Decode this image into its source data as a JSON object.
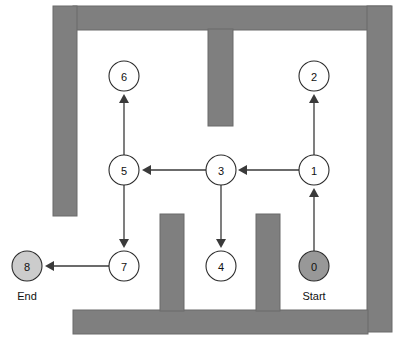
{
  "diagram": {
    "colors": {
      "wall_fill": "#7f7f7f",
      "wall_stroke": "#6b6b6b",
      "background": "#ffffff",
      "node_fill_default": "#ffffff",
      "node_fill_start": "#989898",
      "node_fill_end": "#cccccc",
      "node_stroke": "#2b2b2b",
      "edge_stroke": "#3a3a3a",
      "text": "#111111"
    },
    "nodes": [
      {
        "id": "node-0",
        "label": "0",
        "cx": 314,
        "cy": 266,
        "r": 15,
        "fill": "#989898",
        "caption": "Start",
        "caption_x": 314,
        "caption_y": 300
      },
      {
        "id": "node-1",
        "label": "1",
        "cx": 314,
        "cy": 170,
        "r": 15,
        "fill": "#ffffff",
        "caption": "",
        "caption_x": 0,
        "caption_y": 0
      },
      {
        "id": "node-2",
        "label": "2",
        "cx": 314,
        "cy": 76,
        "r": 15,
        "fill": "#ffffff",
        "caption": "",
        "caption_x": 0,
        "caption_y": 0
      },
      {
        "id": "node-3",
        "label": "3",
        "cx": 221,
        "cy": 170,
        "r": 15,
        "fill": "#ffffff",
        "caption": "",
        "caption_x": 0,
        "caption_y": 0
      },
      {
        "id": "node-4",
        "label": "4",
        "cx": 221,
        "cy": 266,
        "r": 15,
        "fill": "#ffffff",
        "caption": "",
        "caption_x": 0,
        "caption_y": 0
      },
      {
        "id": "node-5",
        "label": "5",
        "cx": 124,
        "cy": 170,
        "r": 15,
        "fill": "#ffffff",
        "caption": "",
        "caption_x": 0,
        "caption_y": 0
      },
      {
        "id": "node-6",
        "label": "6",
        "cx": 124,
        "cy": 76,
        "r": 15,
        "fill": "#ffffff",
        "caption": "",
        "caption_x": 0,
        "caption_y": 0
      },
      {
        "id": "node-7",
        "label": "7",
        "cx": 124,
        "cy": 266,
        "r": 15,
        "fill": "#ffffff",
        "caption": "",
        "caption_x": 0,
        "caption_y": 0
      },
      {
        "id": "node-8",
        "label": "8",
        "cx": 27,
        "cy": 266,
        "r": 15,
        "fill": "#cccccc",
        "caption": "End",
        "caption_x": 27,
        "caption_y": 300
      }
    ],
    "edges": [
      {
        "id": "edge-0-1",
        "from": "0",
        "to": "1",
        "x1": 314,
        "y1": 251,
        "x2": 314,
        "y2": 188,
        "dir": "up"
      },
      {
        "id": "edge-1-2",
        "from": "1",
        "to": "2",
        "x1": 314,
        "y1": 155,
        "x2": 314,
        "y2": 94,
        "dir": "up"
      },
      {
        "id": "edge-1-3",
        "from": "1",
        "to": "3",
        "x1": 299,
        "y1": 170,
        "x2": 238,
        "y2": 170,
        "dir": "left"
      },
      {
        "id": "edge-3-4",
        "from": "3",
        "to": "4",
        "x1": 221,
        "y1": 185,
        "x2": 221,
        "y2": 248,
        "dir": "down"
      },
      {
        "id": "edge-3-5",
        "from": "3",
        "to": "5",
        "x1": 206,
        "y1": 170,
        "x2": 142,
        "y2": 170,
        "dir": "left"
      },
      {
        "id": "edge-5-6",
        "from": "5",
        "to": "6",
        "x1": 124,
        "y1": 155,
        "x2": 124,
        "y2": 94,
        "dir": "up"
      },
      {
        "id": "edge-5-7",
        "from": "5",
        "to": "7",
        "x1": 124,
        "y1": 185,
        "x2": 124,
        "y2": 248,
        "dir": "down"
      },
      {
        "id": "edge-7-8",
        "from": "7",
        "to": "8",
        "x1": 109,
        "y1": 266,
        "x2": 45,
        "y2": 266,
        "dir": "left"
      }
    ],
    "walls": [
      {
        "id": "wall-top",
        "x": 73,
        "y": 6,
        "w": 318,
        "h": 24
      },
      {
        "id": "wall-left",
        "x": 53,
        "y": 6,
        "w": 24,
        "h": 210
      },
      {
        "id": "wall-right",
        "x": 367,
        "y": 6,
        "w": 25,
        "h": 326
      },
      {
        "id": "wall-bottom",
        "x": 73,
        "y": 310,
        "w": 295,
        "h": 24
      },
      {
        "id": "wall-top-interior-vertical",
        "x": 208,
        "y": 29,
        "w": 25,
        "h": 97
      },
      {
        "id": "wall-bottom-interior-left",
        "x": 160,
        "y": 214,
        "w": 24,
        "h": 97
      },
      {
        "id": "wall-bottom-interior-right",
        "x": 256,
        "y": 214,
        "w": 24,
        "h": 97
      }
    ]
  }
}
